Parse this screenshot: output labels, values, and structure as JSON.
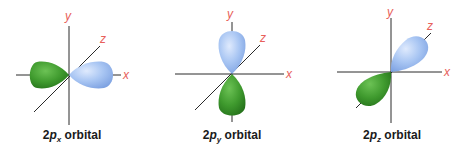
{
  "panels": [
    {
      "id": "2px",
      "caption": {
        "prefix": "2",
        "p": "p",
        "sub": "x",
        "suffix": " orbital"
      },
      "axis_labels": {
        "x": "x",
        "y": "y",
        "z": "z"
      }
    },
    {
      "id": "2py",
      "caption": {
        "prefix": "2",
        "p": "p",
        "sub": "y",
        "suffix": " orbital"
      },
      "axis_labels": {
        "x": "x",
        "y": "y",
        "z": "z"
      }
    },
    {
      "id": "2pz",
      "caption": {
        "prefix": "2",
        "p": "p",
        "sub": "z",
        "suffix": " orbital"
      },
      "axis_labels": {
        "x": "x",
        "y": "y",
        "z": "z"
      }
    }
  ],
  "colors": {
    "positive_lobe": "#a9c8f2",
    "negative_lobe": "#3f9a2e",
    "axis_label": "#e8605a",
    "axis_line": "#2a2a2a"
  }
}
